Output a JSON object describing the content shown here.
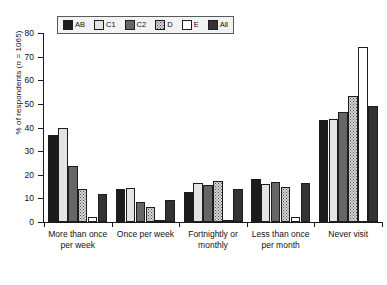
{
  "chart_data": {
    "type": "bar",
    "title": "",
    "xlabel": "",
    "ylabel": "% of respondents (n = 1065)",
    "ylim": [
      0,
      80
    ],
    "yticks": [
      0,
      10,
      20,
      30,
      40,
      50,
      60,
      70,
      80
    ],
    "grid": false,
    "legend_position": "top-left",
    "categories": [
      "More than once per week",
      "Once per week",
      "Fortnightly or monthly",
      "Less than once per month",
      "Never visit"
    ],
    "series": [
      {
        "name": "AB",
        "color": "#1b1b1b",
        "values": [
          37,
          14,
          12.5,
          18,
          43
        ]
      },
      {
        "name": "C1",
        "color": "#e3e3e3",
        "values": [
          40,
          14.5,
          16.5,
          16,
          43.5
        ]
      },
      {
        "name": "C2",
        "color": "#666666",
        "values": [
          23.5,
          8.5,
          15.5,
          17,
          46.5
        ]
      },
      {
        "name": "D",
        "color": "#d8d8d8",
        "values": [
          14,
          6.5,
          17.5,
          15,
          53.5
        ]
      },
      {
        "name": "E",
        "color": "#ffffff",
        "values": [
          2,
          0.5,
          1,
          2,
          74
        ]
      },
      {
        "name": "All",
        "color": "#333333",
        "values": [
          12,
          9.5,
          14,
          16.5,
          49
        ]
      }
    ]
  },
  "legend": {
    "items": [
      {
        "label": "AB",
        "icon": "swatch-solid-black"
      },
      {
        "label": "C1",
        "icon": "swatch-light-gray"
      },
      {
        "label": "C2",
        "icon": "swatch-dark-gray"
      },
      {
        "label": "D",
        "icon": "swatch-dotted"
      },
      {
        "label": "E",
        "icon": "swatch-white"
      },
      {
        "label": "All",
        "icon": "swatch-dark-dotted"
      }
    ]
  },
  "axes": {
    "y_title_prefix": "% of respondents (",
    "y_title_italic": "n",
    "y_title_suffix": " = 1065)",
    "y_labels": [
      "80",
      "70",
      "60",
      "50",
      "40",
      "30",
      "20",
      "10",
      "0"
    ],
    "x_labels": [
      {
        "line1": "More than once",
        "line2": "per week"
      },
      {
        "line1": "Once per week",
        "line2": ""
      },
      {
        "line1": "Fortnightly or",
        "line2": "monthly"
      },
      {
        "line1": "Less than once",
        "line2": "per month"
      },
      {
        "line1": "Never visit",
        "line2": ""
      }
    ]
  }
}
